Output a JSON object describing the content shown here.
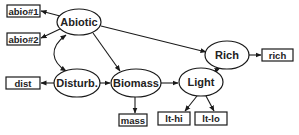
{
  "diagram": {
    "type": "structural-equation-model",
    "colors": {
      "stroke": "#1a1a1a",
      "text": "#222222",
      "background": "#ffffff"
    },
    "latent_nodes": [
      {
        "id": "abiotic",
        "label": "Abiotic"
      },
      {
        "id": "disturb",
        "label": "Disturb."
      },
      {
        "id": "biomass",
        "label": "Biomass"
      },
      {
        "id": "light",
        "label": "Light"
      },
      {
        "id": "rich",
        "label": "Rich"
      }
    ],
    "manifest_nodes": [
      {
        "id": "abio1",
        "label": "abio#1"
      },
      {
        "id": "abio2",
        "label": "abio#2"
      },
      {
        "id": "dist",
        "label": "dist"
      },
      {
        "id": "mass",
        "label": "mass"
      },
      {
        "id": "lthi",
        "label": "lt-hi"
      },
      {
        "id": "ltlo",
        "label": "lt-lo"
      },
      {
        "id": "rich_m",
        "label": "rich"
      }
    ],
    "edges": [
      {
        "from": "abiotic",
        "to": "abio1",
        "kind": "measurement"
      },
      {
        "from": "abiotic",
        "to": "abio2",
        "kind": "measurement"
      },
      {
        "from": "disturb",
        "to": "dist",
        "kind": "measurement"
      },
      {
        "from": "biomass",
        "to": "mass",
        "kind": "measurement"
      },
      {
        "from": "light",
        "to": "lthi",
        "kind": "measurement"
      },
      {
        "from": "light",
        "to": "ltlo",
        "kind": "measurement"
      },
      {
        "from": "rich",
        "to": "rich_m",
        "kind": "measurement"
      },
      {
        "from": "abiotic",
        "to": "disturb",
        "kind": "correlation"
      },
      {
        "from": "abiotic",
        "to": "biomass",
        "kind": "path"
      },
      {
        "from": "abiotic",
        "to": "rich",
        "kind": "path"
      },
      {
        "from": "disturb",
        "to": "biomass",
        "kind": "path"
      },
      {
        "from": "biomass",
        "to": "light",
        "kind": "path"
      },
      {
        "from": "light",
        "to": "rich",
        "kind": "path"
      }
    ]
  }
}
